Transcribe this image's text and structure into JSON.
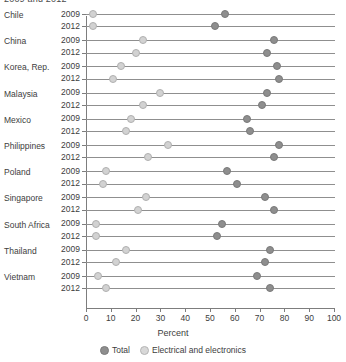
{
  "title": "2009 and 2012",
  "axis": {
    "xlabel": "Percent",
    "xmin": 0,
    "xmax": 100,
    "xticks": [
      0,
      10,
      20,
      30,
      40,
      50,
      60,
      70,
      80,
      90,
      100
    ]
  },
  "legend": {
    "items": [
      {
        "label": "Total",
        "key": "total",
        "color": "#8e8e8e"
      },
      {
        "label": "Electrical and electronics",
        "key": "ee",
        "color": "#d8d8d8"
      }
    ]
  },
  "years": [
    "2009",
    "2012"
  ],
  "chart_data": {
    "type": "scatter",
    "title": "2009 and 2012",
    "xlabel": "Percent",
    "ylabel": "",
    "xlim": [
      0,
      100
    ],
    "xticks": [
      0,
      10,
      20,
      30,
      40,
      50,
      60,
      70,
      80,
      90,
      100
    ],
    "grid": false,
    "legend_position": "bottom",
    "categories": [
      "Chile",
      "China",
      "Korea, Rep.",
      "Malaysia",
      "Mexico",
      "Philippines",
      "Poland",
      "Singapore",
      "South Africa",
      "Thailand",
      "Vietnam"
    ],
    "series": [
      {
        "name": "Total",
        "key": "total",
        "color": "#8e8e8e",
        "points": [
          {
            "country": "Chile",
            "2009": 56,
            "2012": 52
          },
          {
            "country": "China",
            "2009": 76,
            "2012": 73
          },
          {
            "country": "Korea, Rep.",
            "2009": 77,
            "2012": 78
          },
          {
            "country": "Malaysia",
            "2009": 73,
            "2012": 71
          },
          {
            "country": "Mexico",
            "2009": 65,
            "2012": 66
          },
          {
            "country": "Philippines",
            "2009": 78,
            "2012": 76
          },
          {
            "country": "Poland",
            "2009": 57,
            "2012": 61
          },
          {
            "country": "Singapore",
            "2009": 72,
            "2012": 76
          },
          {
            "country": "South Africa",
            "2009": 55,
            "2012": 53
          },
          {
            "country": "Thailand",
            "2009": 74,
            "2012": 72
          },
          {
            "country": "Vietnam",
            "2009": 69,
            "2012": 74
          }
        ]
      },
      {
        "name": "Electrical and electronics",
        "key": "ee",
        "color": "#d8d8d8",
        "points": [
          {
            "country": "Chile",
            "2009": 3,
            "2012": 3
          },
          {
            "country": "China",
            "2009": 23,
            "2012": 20
          },
          {
            "country": "Korea, Rep.",
            "2009": 14,
            "2012": 11
          },
          {
            "country": "Malaysia",
            "2009": 30,
            "2012": 23
          },
          {
            "country": "Mexico",
            "2009": 18,
            "2012": 16
          },
          {
            "country": "Philippines",
            "2009": 33,
            "2012": 25
          },
          {
            "country": "Poland",
            "2009": 8,
            "2012": 7
          },
          {
            "country": "Singapore",
            "2009": 24,
            "2012": 21
          },
          {
            "country": "South Africa",
            "2009": 4,
            "2012": 4
          },
          {
            "country": "Thailand",
            "2009": 16,
            "2012": 12
          },
          {
            "country": "Vietnam",
            "2009": 5,
            "2012": 8
          }
        ]
      }
    ]
  }
}
